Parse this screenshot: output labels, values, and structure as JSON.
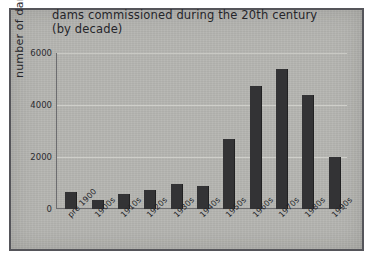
{
  "chart_data": {
    "type": "bar",
    "title": "dams commissioned during the 20th century (by decade)",
    "title_line1": "dams commissioned during the 20th century",
    "title_line2": "(by decade)",
    "xlabel": "",
    "ylabel": "number of dams",
    "ylim": [
      0,
      6000
    ],
    "ytick_labels": [
      "0",
      "2000",
      "4000",
      "6000"
    ],
    "ytick_values": [
      0,
      2000,
      4000,
      6000
    ],
    "grid": "horizontal",
    "legend": "none",
    "categories": [
      "pre 1900",
      "1900s",
      "1910s",
      "1920s",
      "1930s",
      "1940s",
      "1950s",
      "1960s",
      "1970s",
      "1980s",
      "1990s"
    ],
    "values": [
      650,
      350,
      580,
      750,
      950,
      880,
      2700,
      4750,
      5400,
      4400,
      2000
    ],
    "bar_color": "#333335",
    "plot_background": "#b4b4b0",
    "gridline_color": "#cfcfca",
    "axis_color": "#6d6d70",
    "text_color": "#25252a"
  }
}
